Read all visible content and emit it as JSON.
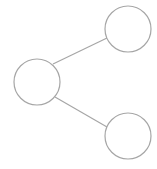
{
  "diagram": {
    "type": "node-link",
    "stroke_color": "#a6a6a6",
    "background": "#ffffff",
    "nodes": [
      {
        "id": "left",
        "cx": 37,
        "cy": 82,
        "r": 23
      },
      {
        "id": "top-right",
        "cx": 128,
        "cy": 29,
        "r": 23
      },
      {
        "id": "bottom-right",
        "cx": 128,
        "cy": 136,
        "r": 23
      }
    ],
    "edges": [
      {
        "from": "left",
        "to": "top-right"
      },
      {
        "from": "left",
        "to": "bottom-right"
      }
    ]
  }
}
